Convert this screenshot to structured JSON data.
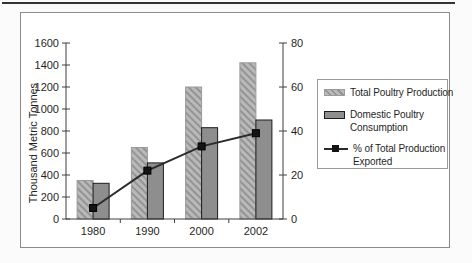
{
  "chart_data": {
    "type": "bar",
    "subtype": "grouped-bars-with-line-overlay",
    "categories": [
      "1980",
      "1990",
      "2000",
      "2002"
    ],
    "series": [
      {
        "name": "Total Poultry Production",
        "type": "bar",
        "axis": "left",
        "style": "hatched-light-gray",
        "values": [
          350,
          650,
          1200,
          1420
        ]
      },
      {
        "name": "Domestic Poultry Consumption",
        "type": "bar",
        "axis": "left",
        "style": "solid-gray",
        "values": [
          325,
          510,
          830,
          900
        ]
      },
      {
        "name": "% of Total Production Exported",
        "type": "line",
        "axis": "right",
        "marker": "filled-square",
        "values": [
          5,
          22,
          33,
          39
        ]
      }
    ],
    "left_axis": {
      "label": "Thousand Metric Tonnes",
      "min": 0,
      "max": 1600,
      "tick_step": 200
    },
    "right_axis": {
      "label": "",
      "min": 0,
      "max": 80,
      "tick_step": 20
    },
    "grid": false,
    "legend_position": "right"
  },
  "legend": {
    "items": [
      {
        "label": "Total Poultry Production"
      },
      {
        "label": "Domestic Poultry\nConsumption"
      },
      {
        "label": "% of Total Production\nExported"
      }
    ]
  },
  "colors": {
    "background": "#ffffff",
    "rule_color": "#333333",
    "frame_border": "#8a8a8a",
    "legend_border": "#9a9a9a",
    "axis_color": "#3f3f3f",
    "text_color": "#1f1f1f",
    "total_bar_fill": "#b9b9b9",
    "total_bar_hatch": "#949494",
    "total_bar_border": "#9b9b9b",
    "domestic_bar_fill": "#8e8e8e",
    "domestic_bar_border": "#1c1c1c",
    "line_color": "#2b2b2b",
    "marker_color": "#141414"
  }
}
